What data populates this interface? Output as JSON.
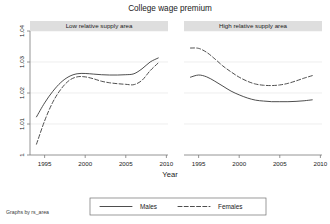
{
  "chart_data": {
    "type": "line",
    "title": "College wage premium",
    "xlabel": "Year",
    "ylabel": "",
    "note": "Graphs by rs_area",
    "grid": true,
    "legend_position": "bottom",
    "xlim": [
      1993.2,
      2010.2
    ],
    "ylim": [
      1,
      1.04
    ],
    "xticks": [
      1995,
      2000,
      2005,
      2010
    ],
    "xtick_labels": [
      "1995",
      "2000",
      "2005",
      "2010"
    ],
    "yticks": [
      1,
      1.01,
      1.02,
      1.03,
      1.04
    ],
    "ytick_labels": [
      "1",
      "1.01",
      "1.02",
      "1.03",
      "1.04"
    ],
    "legend": [
      {
        "name": "Males",
        "style": "solid"
      },
      {
        "name": "Females",
        "style": "dashed"
      }
    ],
    "panels": [
      {
        "title": "Low relative supply area",
        "x": [
          1994,
          1995,
          1996,
          1997,
          1998,
          1999,
          2000,
          2001,
          2002,
          2003,
          2004,
          2005,
          2006,
          2007,
          2008,
          2009
        ],
        "series": [
          {
            "name": "Males",
            "style": "solid",
            "values": [
              1.0123,
              1.0168,
              1.0205,
              1.0234,
              1.0253,
              1.0262,
              1.0263,
              1.0261,
              1.0259,
              1.0258,
              1.0258,
              1.0259,
              1.0262,
              1.0278,
              1.03,
              1.0313
            ]
          },
          {
            "name": "Females",
            "style": "dashed",
            "values": [
              1.0035,
              1.011,
              1.017,
              1.0212,
              1.024,
              1.0252,
              1.0252,
              1.0246,
              1.0238,
              1.0233,
              1.023,
              1.0228,
              1.0227,
              1.0241,
              1.0272,
              1.0297
            ]
          }
        ]
      },
      {
        "title": "High relative supply area",
        "x": [
          1994,
          1995,
          1996,
          1997,
          1998,
          1999,
          2000,
          2001,
          2002,
          2003,
          2004,
          2005,
          2006,
          2007,
          2008,
          2009
        ],
        "series": [
          {
            "name": "Males",
            "style": "solid",
            "values": [
              1.0251,
              1.0258,
              1.0252,
              1.0238,
              1.0222,
              1.0206,
              1.0194,
              1.0184,
              1.0177,
              1.0174,
              1.0172,
              1.0172,
              1.0172,
              1.0173,
              1.0175,
              1.0178
            ]
          },
          {
            "name": "Females",
            "style": "dashed",
            "values": [
              1.0345,
              1.0344,
              1.0331,
              1.031,
              1.0287,
              1.0268,
              1.0251,
              1.0238,
              1.0229,
              1.0225,
              1.0224,
              1.0226,
              1.0231,
              1.0239,
              1.0248,
              1.0256
            ]
          }
        ]
      }
    ]
  }
}
